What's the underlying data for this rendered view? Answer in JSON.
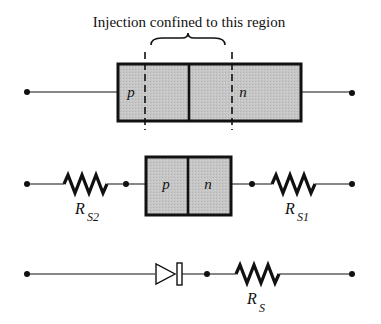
{
  "diagram": {
    "caption": "Injection confined to this region",
    "top_device": {
      "p_label": "p",
      "n_label": "n"
    },
    "middle_circuit": {
      "p_label": "p",
      "n_label": "n",
      "left_resistor": {
        "symbol": "R",
        "subscript": "S2"
      },
      "right_resistor": {
        "symbol": "R",
        "subscript": "S1"
      }
    },
    "bottom_circuit": {
      "element": "diode",
      "resistor": {
        "symbol": "R",
        "subscript": "S"
      }
    },
    "colors": {
      "fill": "#c4c4c4",
      "stroke": "#111111"
    }
  }
}
